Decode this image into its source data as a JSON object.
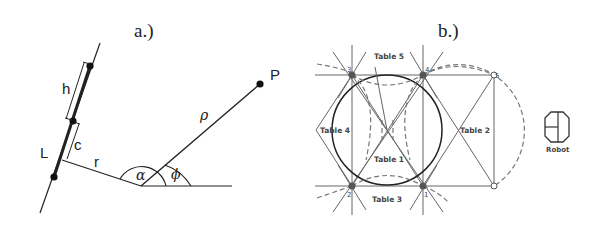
{
  "figure": {
    "panel_a": {
      "label": "a.)",
      "symbols": {
        "line": "L",
        "segment_h": "h",
        "segment_c": "c",
        "perpendicular": "r",
        "radius": "ρ",
        "angle_alpha": "α",
        "angle_phi": "ϕ",
        "point": "P"
      }
    },
    "panel_b": {
      "label": "b.)",
      "tables": [
        "Table 1",
        "Table 2",
        "Table 3",
        "Table 4",
        "Table 5"
      ],
      "nodes": [
        "1",
        "2",
        "3",
        "4",
        "5",
        "6"
      ],
      "robot_label": "Robot"
    }
  }
}
